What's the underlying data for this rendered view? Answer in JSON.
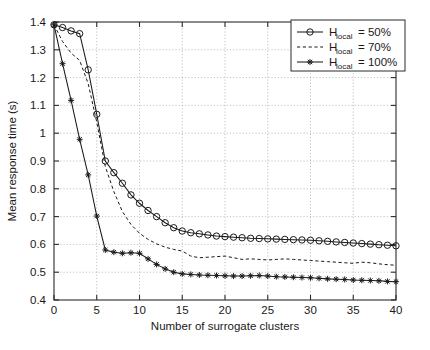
{
  "chart_data": {
    "type": "line",
    "title": "",
    "xlabel": "Number of surrogate clusters",
    "ylabel": "Mean response time (s)",
    "xlim": [
      0,
      40
    ],
    "ylim": [
      0.4,
      1.4
    ],
    "xticks": [
      0,
      5,
      10,
      15,
      20,
      25,
      30,
      35,
      40
    ],
    "xtick_labels": [
      "0",
      "5",
      "10",
      "15",
      "20",
      "25",
      "30",
      "35",
      "40"
    ],
    "yticks": [
      0.4,
      0.5,
      0.6,
      0.7,
      0.8,
      0.9,
      1.0,
      1.1,
      1.2,
      1.3,
      1.4
    ],
    "ytick_labels": [
      "0.4",
      "0.5",
      "0.6",
      "0.7",
      "0.8",
      "0.9",
      "1",
      "1.1",
      "1.2",
      "1.3",
      "1.4"
    ],
    "grid": true,
    "legend_position": "upper right",
    "x": [
      0,
      1,
      2,
      3,
      4,
      5,
      6,
      7,
      8,
      9,
      10,
      11,
      12,
      13,
      14,
      15,
      16,
      17,
      18,
      19,
      20,
      21,
      22,
      23,
      24,
      25,
      26,
      27,
      28,
      29,
      30,
      31,
      32,
      33,
      34,
      35,
      36,
      37,
      38,
      39,
      40
    ],
    "series": [
      {
        "name": "H_local = 50%",
        "label_base": "H",
        "label_sub": "local",
        "label_value": "= 50%",
        "marker": "circle",
        "linestyle": "solid",
        "values": [
          1.39,
          1.38,
          1.368,
          1.358,
          1.228,
          1.068,
          0.9,
          0.858,
          0.82,
          0.778,
          0.748,
          0.722,
          0.7,
          0.678,
          0.66,
          0.648,
          0.642,
          0.638,
          0.634,
          0.63,
          0.628,
          0.626,
          0.624,
          0.622,
          0.621,
          0.62,
          0.619,
          0.618,
          0.617,
          0.616,
          0.615,
          0.613,
          0.611,
          0.609,
          0.607,
          0.605,
          0.603,
          0.601,
          0.599,
          0.597,
          0.595
        ]
      },
      {
        "name": "H_local = 70%",
        "label_base": "H",
        "label_sub": "local",
        "label_value": "= 70%",
        "marker": "none",
        "linestyle": "dashed",
        "values": [
          1.39,
          1.33,
          1.288,
          1.262,
          1.178,
          1.04,
          0.88,
          0.79,
          0.718,
          0.672,
          0.64,
          0.618,
          0.602,
          0.59,
          0.582,
          0.576,
          0.558,
          0.552,
          0.554,
          0.556,
          0.558,
          0.552,
          0.546,
          0.548,
          0.546,
          0.544,
          0.546,
          0.548,
          0.546,
          0.544,
          0.542,
          0.54,
          0.538,
          0.536,
          0.534,
          0.532,
          0.536,
          0.534,
          0.53,
          0.527,
          0.525
        ]
      },
      {
        "name": "H_local = 100%",
        "label_base": "H",
        "label_sub": "local",
        "label_value": "= 100%",
        "marker": "star",
        "linestyle": "solid",
        "values": [
          1.39,
          1.25,
          1.118,
          0.978,
          0.85,
          0.702,
          0.58,
          0.572,
          0.568,
          0.57,
          0.568,
          0.548,
          0.528,
          0.512,
          0.5,
          0.494,
          0.492,
          0.49,
          0.489,
          0.488,
          0.487,
          0.486,
          0.486,
          0.487,
          0.488,
          0.486,
          0.484,
          0.483,
          0.482,
          0.481,
          0.48,
          0.478,
          0.476,
          0.475,
          0.474,
          0.472,
          0.471,
          0.47,
          0.469,
          0.467,
          0.466
        ]
      }
    ]
  }
}
